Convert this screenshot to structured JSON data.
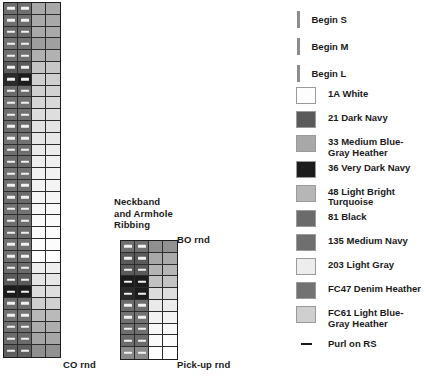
{
  "palette": {
    "white_1a": "#fdfdfd",
    "dark_navy_21": "#5a5a5a",
    "med_bg_heather_33": "#a8a8a8",
    "very_dark_navy_36": "#1c1c1c",
    "light_bright_turq_48": "#b6b6b6",
    "black_81": "#6b6b6b",
    "med_navy_135": "#6f6f6f",
    "light_gray_203": "#ededed",
    "denim_heather_fc47": "#727272",
    "light_bg_heather_fc61": "#cfcfcf",
    "cell_grid": "#2c2c2c",
    "chart_border": "#1d1d1d",
    "tick_gray": "#8c8c8c",
    "text": "#1a1a1a"
  },
  "begin_marks": [
    {
      "label": "Begin S"
    },
    {
      "label": "Begin M"
    },
    {
      "label": "Begin L"
    }
  ],
  "legend": {
    "title": "",
    "swatches": [
      {
        "code": "1A",
        "name": "1A White",
        "color": "#fdfdfd"
      },
      {
        "code": "21",
        "name": "21 Dark Navy",
        "color": "#5a5a5a"
      },
      {
        "code": "33",
        "name": "33 Medium Blue-\nGray Heather",
        "color": "#a8a8a8"
      },
      {
        "code": "36",
        "name": "36 Very Dark Navy",
        "color": "#1c1c1c"
      },
      {
        "code": "48",
        "name": "48 Light Bright\nTurquoise",
        "color": "#b6b6b6"
      },
      {
        "code": "81",
        "name": "81 Black",
        "color": "#6b6b6b"
      },
      {
        "code": "135",
        "name": "135 Medium Navy",
        "color": "#6f6f6f"
      },
      {
        "code": "203",
        "name": "203 Light Gray",
        "color": "#ededed"
      },
      {
        "code": "FC47",
        "name": "FC47 Denim Heather",
        "color": "#727272"
      },
      {
        "code": "FC61",
        "name": "FC61 Light Blue-\nGray Heather",
        "color": "#cfcfcf"
      }
    ],
    "symbol_key": {
      "symbol": "—",
      "name": "Purl on RS"
    }
  },
  "labels": {
    "neckband": "Neckband\nand Armhole\nRibbing",
    "bo_rnd": "BO rnd",
    "co_rnd": "CO rnd",
    "pickup_rnd": "Pick-up rnd"
  },
  "chart_data": {
    "type": "heatmap",
    "title": "",
    "xlabel": "",
    "ylabel": "",
    "grid": true,
    "legend_position": "right",
    "charts": [
      {
        "name": "main-body-chart",
        "columns": 4,
        "rows": 30,
        "cell_width_px": 14,
        "cell_height_px": 11.8,
        "col_labels": [
          "1",
          "2",
          "3",
          "4"
        ],
        "purl_columns": [
          0,
          1
        ],
        "rows_data": [
          [
            "#6f6f6f",
            "#6f6f6f",
            "#a8a8a8",
            "#a8a8a8"
          ],
          [
            "#6f6f6f",
            "#6f6f6f",
            "#a8a8a8",
            "#a8a8a8"
          ],
          [
            "#6b6b6b",
            "#6b6b6b",
            "#a8a8a8",
            "#a8a8a8"
          ],
          [
            "#727272",
            "#727272",
            "#9e9e9e",
            "#a0a0a0"
          ],
          [
            "#6f6f6f",
            "#6f6f6f",
            "#b0b0b0",
            "#b2b2b2"
          ],
          [
            "#5a5a5a",
            "#5a5a5a",
            "#c4c4c4",
            "#c6c6c6"
          ],
          [
            "#2a2a2a",
            "#1c1c1c",
            "#cfcfcf",
            "#cfcfcf"
          ],
          [
            "#6b6b6b",
            "#6b6b6b",
            "#d0d0d0",
            "#d2d2d2"
          ],
          [
            "#727272",
            "#727272",
            "#d6d6d6",
            "#d8d8d8"
          ],
          [
            "#6f6f6f",
            "#6f6f6f",
            "#dcdcdc",
            "#dedede"
          ],
          [
            "#6b6b6b",
            "#6b6b6b",
            "#e2e2e2",
            "#e4e4e4"
          ],
          [
            "#727272",
            "#727272",
            "#e6e6e6",
            "#e8e8e8"
          ],
          [
            "#6f6f6f",
            "#6f6f6f",
            "#eaeaea",
            "#ececec"
          ],
          [
            "#6b6b6b",
            "#6b6b6b",
            "#ededed",
            "#efefef"
          ],
          [
            "#727272",
            "#727272",
            "#f0f0f0",
            "#f1f1f1"
          ],
          [
            "#6f6f6f",
            "#6f6f6f",
            "#f3f3f3",
            "#f4f4f4"
          ],
          [
            "#6b6b6b",
            "#6b6b6b",
            "#f5f5f5",
            "#f6f6f6"
          ],
          [
            "#727272",
            "#727272",
            "#f7f7f7",
            "#f8f8f8"
          ],
          [
            "#6f6f6f",
            "#6f6f6f",
            "#f9f9f9",
            "#fafafa"
          ],
          [
            "#6b6b6b",
            "#6b6b6b",
            "#fafafa",
            "#fbfbfb"
          ],
          [
            "#727272",
            "#727272",
            "#fcfcfc",
            "#fcfcfc"
          ],
          [
            "#6f6f6f",
            "#6f6f6f",
            "#fdfdfd",
            "#fdfdfd"
          ],
          [
            "#6b6b6b",
            "#6b6b6b",
            "#ededed",
            "#efefef"
          ],
          [
            "#5a5a5a",
            "#5a5a5a",
            "#e4e4e4",
            "#e6e6e6"
          ],
          [
            "#1c1c1c",
            "#1c1c1c",
            "#dcdcdc",
            "#dedede"
          ],
          [
            "#6b6b6b",
            "#6b6b6b",
            "#cfcfcf",
            "#d1d1d1"
          ],
          [
            "#727272",
            "#727272",
            "#b8b8b8",
            "#bababa"
          ],
          [
            "#6f6f6f",
            "#6f6f6f",
            "#acacac",
            "#aeaeae"
          ],
          [
            "#6b6b6b",
            "#6b6b6b",
            "#a4a4a4",
            "#a6a6a6"
          ],
          [
            "#5f5f5f",
            "#5f5f5f",
            "#8f8f8f",
            "#919191"
          ]
        ]
      },
      {
        "name": "neckband-armhole-ribbing-chart",
        "columns": 4,
        "rows": 10,
        "cell_width_px": 14,
        "cell_height_px": 11.8,
        "col_labels": [
          "1",
          "2",
          "3",
          "4"
        ],
        "purl_columns": [
          0,
          1
        ],
        "rows_data": [
          [
            "#6f6f6f",
            "#6f6f6f",
            "#8f8f8f",
            "#919191"
          ],
          [
            "#5a5a5a",
            "#5a5a5a",
            "#a8a8a8",
            "#aaaaaa"
          ],
          [
            "#5a5a5a",
            "#5a5a5a",
            "#b4b4b4",
            "#b6b6b6"
          ],
          [
            "#1c1c1c",
            "#1c1c1c",
            "#c2c2c2",
            "#c4c4c4"
          ],
          [
            "#2a2a2a",
            "#1c1c1c",
            "#dcdcdc",
            "#dedede"
          ],
          [
            "#6b6b6b",
            "#6b6b6b",
            "#eaeaea",
            "#ececec"
          ],
          [
            "#727272",
            "#727272",
            "#f2f2f2",
            "#f3f3f3"
          ],
          [
            "#6f6f6f",
            "#6f6f6f",
            "#f7f7f7",
            "#f8f8f8"
          ],
          [
            "#6b6b6b",
            "#6b6b6b",
            "#fafafa",
            "#fbfbfb"
          ],
          [
            "#8a8a8a",
            "#8a8a8a",
            "#fdfdfd",
            "#fdfdfd"
          ]
        ]
      }
    ]
  }
}
